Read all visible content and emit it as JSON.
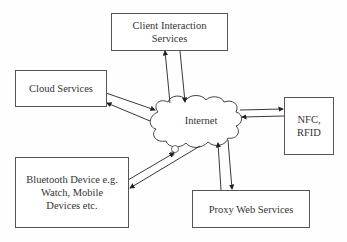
{
  "diagram": {
    "hub": {
      "label": "Internet",
      "shape": "cloud"
    },
    "nodes": [
      {
        "id": "client",
        "label": "Client Interaction\nServices"
      },
      {
        "id": "cloud",
        "label": "Cloud Services"
      },
      {
        "id": "nfc",
        "label": "NFC,\nRFID"
      },
      {
        "id": "bluetooth",
        "label": "Bluetooth Device e.g.\nWatch, Mobile\nDevices etc."
      },
      {
        "id": "proxy",
        "label": "Proxy Web Services"
      }
    ],
    "edges": [
      {
        "from": "client",
        "to": "internet",
        "bidirectional": true
      },
      {
        "from": "cloud",
        "to": "internet",
        "bidirectional": true
      },
      {
        "from": "nfc",
        "to": "internet",
        "bidirectional": true
      },
      {
        "from": "bluetooth",
        "to": "internet",
        "bidirectional": true
      },
      {
        "from": "proxy",
        "to": "internet",
        "bidirectional": true
      }
    ],
    "colors": {
      "line": "#333333",
      "border": "#555555",
      "background": "#ffffff"
    }
  }
}
